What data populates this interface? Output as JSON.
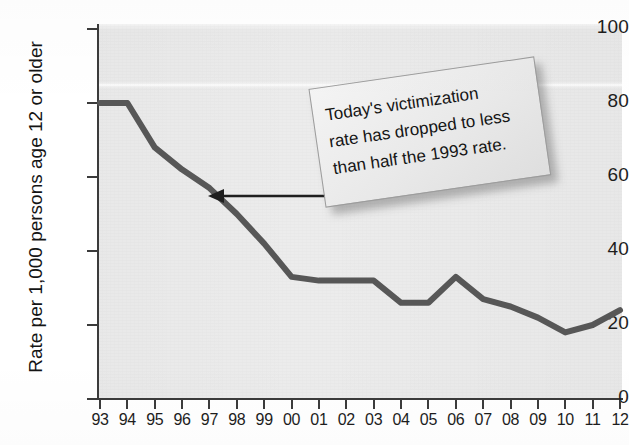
{
  "figure": {
    "plot_bg_color": "#ececec",
    "line_color": "#575757",
    "axis_color": "#3b3b3b",
    "callout_bg_color": "#eeeeee"
  },
  "callout": {
    "name": "callout-note",
    "text": "Today's victimization rate has dropped to less than half the 1993 rate.",
    "line1": "Today's victimization",
    "line2": "rate has dropped to less",
    "line3": "than half the 1993 rate."
  },
  "annotation": {
    "arrow_label": "arrow pointing to 1998 data point"
  },
  "chart_data": {
    "type": "line",
    "title": "",
    "xlabel": "",
    "ylabel": "Rate per 1,000 persons age 12 or older",
    "categories": [
      "93",
      "94",
      "95",
      "96",
      "97",
      "98",
      "99",
      "00",
      "01",
      "02",
      "03",
      "04",
      "05",
      "06",
      "07",
      "08",
      "09",
      "10",
      "11",
      "12"
    ],
    "values": [
      80,
      80,
      68,
      62,
      57,
      50,
      42,
      33,
      32,
      32,
      32,
      26,
      26,
      33,
      27,
      25,
      22,
      18,
      20,
      24
    ],
    "ylim": [
      0,
      100
    ],
    "yticks": [
      0,
      20,
      40,
      60,
      80,
      100
    ],
    "grid": false,
    "legend": false
  }
}
